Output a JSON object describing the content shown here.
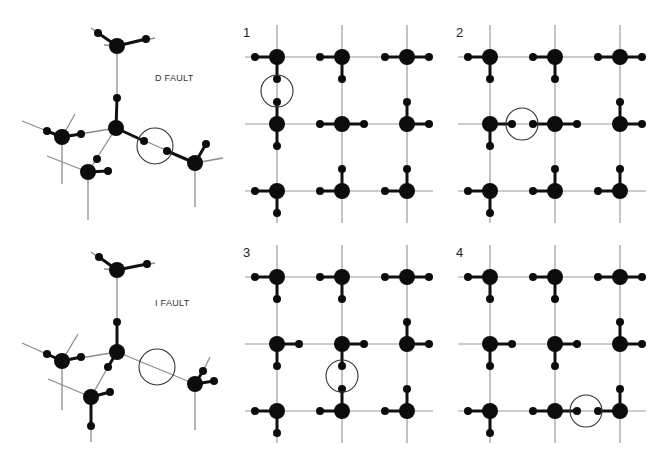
{
  "figure": {
    "colors": {
      "atom": "#0c0c0c",
      "grid": "#9a9a9a",
      "circle": "#333333",
      "background": "#ffffff"
    },
    "models": [
      {
        "id": "d-fault",
        "label": "D FAULT",
        "label_pos": [
          155,
          81
        ],
        "circle": {
          "cx": 155,
          "cy": 146,
          "r": 18
        }
      },
      {
        "id": "i-fault",
        "label": "I FAULT",
        "label_pos": [
          155,
          306
        ],
        "circle": {
          "cx": 157,
          "cy": 367,
          "r": 18
        }
      }
    ],
    "panels": [
      {
        "number": "1",
        "origin": [
          277,
          57
        ],
        "label_pos": [
          243,
          37
        ],
        "atoms": [
          [
            "L",
            "D"
          ],
          [
            "L",
            "D"
          ],
          [
            "L",
            "R"
          ],
          [
            "U",
            "D"
          ],
          [
            "L",
            "R"
          ],
          [
            "U",
            "R"
          ],
          [
            "L",
            "D"
          ],
          [
            "L",
            "U"
          ],
          [
            "L",
            "U"
          ]
        ],
        "circle": {
          "cx": 277,
          "cy": 91,
          "r": 16
        }
      },
      {
        "number": "2",
        "origin": [
          490,
          57
        ],
        "label_pos": [
          456,
          37
        ],
        "atoms": [
          [
            "L",
            "D"
          ],
          [
            "L",
            "D"
          ],
          [
            "L",
            "R"
          ],
          [
            "R",
            "D"
          ],
          [
            "L",
            "R"
          ],
          [
            "U",
            "R"
          ],
          [
            "L",
            "D"
          ],
          [
            "L",
            "U"
          ],
          [
            "L",
            "U"
          ]
        ],
        "circle": {
          "cx": 522,
          "cy": 124,
          "r": 16
        }
      },
      {
        "number": "3",
        "origin": [
          277,
          277
        ],
        "label_pos": [
          243,
          257
        ],
        "atoms": [
          [
            "L",
            "D"
          ],
          [
            "L",
            "D"
          ],
          [
            "L",
            "R"
          ],
          [
            "R",
            "D"
          ],
          [
            "R",
            "D"
          ],
          [
            "U",
            "R"
          ],
          [
            "L",
            "D"
          ],
          [
            "L",
            "U"
          ],
          [
            "L",
            "U"
          ]
        ],
        "circle": {
          "cx": 342,
          "cy": 376,
          "r": 16
        }
      },
      {
        "number": "4",
        "origin": [
          490,
          277
        ],
        "label_pos": [
          456,
          257
        ],
        "atoms": [
          [
            "L",
            "D"
          ],
          [
            "L",
            "D"
          ],
          [
            "L",
            "R"
          ],
          [
            "R",
            "D"
          ],
          [
            "R",
            "D"
          ],
          [
            "U",
            "R"
          ],
          [
            "L",
            "D"
          ],
          [
            "L",
            "R"
          ],
          [
            "L",
            "U"
          ]
        ],
        "circle": {
          "cx": 586,
          "cy": 411,
          "r": 16
        }
      }
    ]
  }
}
